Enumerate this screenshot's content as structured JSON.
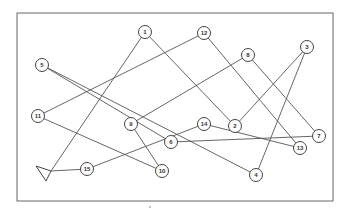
{
  "diagram": {
    "frame": {
      "x": 17,
      "y": 13,
      "width": 316,
      "height": 188
    },
    "start_marker": {
      "type": "triangle",
      "points": "36,166 51,171 46,181",
      "x": 51,
      "y": 171
    },
    "nodes": [
      {
        "id": "1",
        "label": "1",
        "x": 145,
        "y": 32
      },
      {
        "id": "12",
        "label": "12",
        "x": 204,
        "y": 33
      },
      {
        "id": "8",
        "label": "8",
        "x": 248,
        "y": 55
      },
      {
        "id": "3",
        "label": "3",
        "x": 307,
        "y": 47
      },
      {
        "id": "5",
        "label": "5",
        "x": 42,
        "y": 65
      },
      {
        "id": "2",
        "label": "2",
        "x": 235,
        "y": 126
      },
      {
        "id": "7",
        "label": "7",
        "x": 319,
        "y": 136
      },
      {
        "id": "11",
        "label": "11",
        "x": 38,
        "y": 116
      },
      {
        "id": "9",
        "label": "9",
        "x": 131,
        "y": 124
      },
      {
        "id": "14",
        "label": "14",
        "x": 204,
        "y": 124
      },
      {
        "id": "6",
        "label": "6",
        "x": 171,
        "y": 142
      },
      {
        "id": "13",
        "label": "13",
        "x": 300,
        "y": 148
      },
      {
        "id": "15",
        "label": "15",
        "x": 87,
        "y": 169
      },
      {
        "id": "10",
        "label": "10",
        "x": 162,
        "y": 171
      },
      {
        "id": "4",
        "label": "4",
        "x": 256,
        "y": 175
      }
    ],
    "edges": [
      {
        "from": "start",
        "to": "1"
      },
      {
        "from": "start",
        "to": "15"
      },
      {
        "from": "1",
        "to": "2"
      },
      {
        "from": "12",
        "to": "11"
      },
      {
        "from": "12",
        "to": "13"
      },
      {
        "from": "8",
        "to": "9"
      },
      {
        "from": "8",
        "to": "7"
      },
      {
        "from": "3",
        "to": "2"
      },
      {
        "from": "3",
        "to": "4"
      },
      {
        "from": "5",
        "to": "6"
      },
      {
        "from": "5",
        "to": "4"
      },
      {
        "from": "11",
        "to": "10"
      },
      {
        "from": "9",
        "to": "10"
      },
      {
        "from": "15",
        "to": "14"
      },
      {
        "from": "14",
        "to": "13"
      },
      {
        "from": "6",
        "to": "7"
      }
    ],
    "stray_mark": {
      "x": 150,
      "y": 207
    },
    "colors": {
      "line": "#555555",
      "frame": "#666666",
      "node_fill": "#ffffff"
    }
  }
}
